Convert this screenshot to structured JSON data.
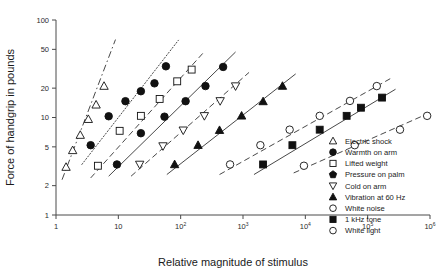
{
  "chart_data": {
    "type": "scatter",
    "title": "",
    "xlabel": "Relative magnitude of stimulus",
    "ylabel": "Force of handgrip in pounds",
    "xscale": "log",
    "yscale": "log",
    "xlim": [
      1,
      1000000
    ],
    "ylim": [
      1,
      100
    ],
    "grid": false,
    "legend_position": "bottom-right",
    "xticks": [
      {
        "value": 1,
        "label": "1",
        "mantissa": "1",
        "exponent": ""
      },
      {
        "value": 10,
        "label": "10",
        "mantissa": "10",
        "exponent": ""
      },
      {
        "value": 100,
        "label": "10^2",
        "mantissa": "10",
        "exponent": "2"
      },
      {
        "value": 1000,
        "label": "10^3",
        "mantissa": "10",
        "exponent": "3"
      },
      {
        "value": 10000,
        "label": "10^4",
        "mantissa": "10",
        "exponent": "4"
      },
      {
        "value": 100000,
        "label": "10^5",
        "mantissa": "10",
        "exponent": "5"
      },
      {
        "value": 1000000,
        "label": "10^6",
        "mantissa": "10",
        "exponent": "6"
      }
    ],
    "yticks": [
      {
        "value": 100,
        "label": "100"
      },
      {
        "value": 50,
        "label": "50"
      },
      {
        "value": 20,
        "label": "20"
      },
      {
        "value": 10,
        "label": "10"
      },
      {
        "value": 5,
        "label": "5"
      },
      {
        "value": 2,
        "label": "2"
      },
      {
        "value": 1,
        "label": "1"
      }
    ],
    "series": [
      {
        "name": "Electric shock",
        "marker": "triangle-up-open",
        "line_style": "dashdot",
        "points": [
          [
            1.45,
            3.1
          ],
          [
            1.85,
            4.6
          ],
          [
            2.45,
            6.6
          ],
          [
            3.3,
            9.6
          ],
          [
            4.4,
            13.5
          ],
          [
            5.9,
            21.0
          ]
        ],
        "fit": {
          "x0": 1.25,
          "y0": 2.3,
          "x1": 9.0,
          "y1": 63.0
        }
      },
      {
        "name": "Warmth on arm",
        "marker": "circle-filled",
        "line_style": "dotted",
        "points": [
          [
            3.6,
            5.2
          ],
          [
            7.0,
            10.3
          ],
          [
            13.0,
            14.7
          ],
          [
            23.0,
            18.6
          ],
          [
            38.0,
            22.4
          ],
          [
            58.0,
            33.5
          ]
        ],
        "fit": {
          "x0": 2.6,
          "y0": 3.3,
          "x1": 92.0,
          "y1": 62.0
        }
      },
      {
        "name": "Lifted weight",
        "marker": "square-open",
        "line_style": "dashed",
        "points": [
          [
            4.7,
            3.2
          ],
          [
            10.5,
            7.3
          ],
          [
            23.0,
            10.4
          ],
          [
            46.0,
            15.5
          ],
          [
            88.0,
            23.5
          ],
          [
            150.0,
            31.0
          ]
        ],
        "fit": {
          "x0": 3.6,
          "y0": 2.4,
          "x1": 230.0,
          "y1": 46.0
        }
      },
      {
        "name": "Pressure on palm",
        "marker": "circle-filled",
        "line_style": "solid",
        "points": [
          [
            9.5,
            3.3
          ],
          [
            23.0,
            6.9
          ],
          [
            55.0,
            10.2
          ],
          [
            120.0,
            14.7
          ],
          [
            250.0,
            21.0
          ],
          [
            480.0,
            33.0
          ]
        ],
        "fit": {
          "x0": 7.0,
          "y0": 2.5,
          "x1": 760.0,
          "y1": 47.0
        }
      },
      {
        "name": "Cold on arm",
        "marker": "triangle-down-open",
        "line_style": "dashed",
        "points": [
          [
            22.0,
            3.3
          ],
          [
            52.0,
            5.1
          ],
          [
            110.0,
            7.4
          ],
          [
            240.0,
            10.4
          ],
          [
            430.0,
            14.8
          ],
          [
            760.0,
            21.0
          ]
        ],
        "fit": {
          "x0": 16.0,
          "y0": 2.5,
          "x1": 1250.0,
          "y1": 29.0
        }
      },
      {
        "name": "Vibration at 60 Hz",
        "marker": "triangle-up-filled",
        "line_style": "solid",
        "points": [
          [
            80.0,
            3.3
          ],
          [
            190.0,
            5.2
          ],
          [
            420.0,
            7.4
          ],
          [
            950.0,
            10.4
          ],
          [
            2100.0,
            14.6
          ],
          [
            4300.0,
            21.0
          ]
        ],
        "fit": {
          "x0": 60.0,
          "y0": 2.6,
          "x1": 7000.0,
          "y1": 28.0
        }
      },
      {
        "name": "White noise",
        "marker": "circle-open",
        "line_style": "dashed",
        "points": [
          [
            620.0,
            3.3
          ],
          [
            1900.0,
            5.2
          ],
          [
            5600.0,
            7.5
          ],
          [
            17000.0,
            10.4
          ],
          [
            52000.0,
            14.8
          ],
          [
            140000.0,
            21.0
          ]
        ],
        "fit": {
          "x0": 420.0,
          "y0": 2.6,
          "x1": 230000.0,
          "y1": 25.0
        }
      },
      {
        "name": "1 kHz tone",
        "marker": "square-filled",
        "line_style": "solid",
        "points": [
          [
            2100.0,
            3.3
          ],
          [
            6200.0,
            5.2
          ],
          [
            17000.0,
            7.5
          ],
          [
            46000.0,
            10.4
          ],
          [
            78000.0,
            12.6
          ],
          [
            170000.0,
            16.0
          ]
        ],
        "fit": {
          "x0": 1500.0,
          "y0": 2.6,
          "x1": 280000.0,
          "y1": 19.5
        }
      },
      {
        "name": "White light",
        "marker": "circle-open",
        "line_style": "dashed",
        "points": [
          [
            9500.0,
            3.2
          ],
          [
            62000.0,
            5.2
          ],
          [
            330000.0,
            7.5
          ],
          [
            900000.0,
            10.4
          ]
        ],
        "fit": {
          "x0": 6500.0,
          "y0": 2.7,
          "x1": 1000000.0,
          "y1": 11.2
        }
      }
    ]
  },
  "legend": {
    "items": [
      {
        "label": "Electric shock",
        "marker": "triangle-up-open"
      },
      {
        "label": "Warmth on arm",
        "marker": "circle-filled"
      },
      {
        "label": "Lifted weight",
        "marker": "square-open"
      },
      {
        "label": "Pressure on palm",
        "marker": "pentagon-filled"
      },
      {
        "label": "Cold on arm",
        "marker": "triangle-down-open"
      },
      {
        "label": "Vibration at 60 Hz",
        "marker": "triangle-up-filled"
      },
      {
        "label": "White noise",
        "marker": "circle-open"
      },
      {
        "label": "1 kHz tone",
        "marker": "square-filled"
      },
      {
        "label": "White light",
        "marker": "circle-open"
      }
    ]
  }
}
